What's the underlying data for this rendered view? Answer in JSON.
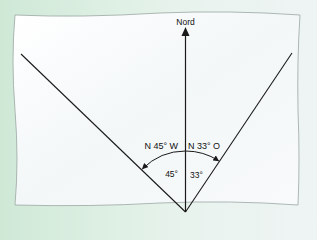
{
  "diagram": {
    "north_label": "Nord",
    "bearing_left_label": "N 45° W",
    "bearing_right_label": "N 33° O",
    "angle_left_label": "45°",
    "angle_right_label": "33°",
    "colors": {
      "background": "#d8ede0",
      "paper": "#f7fafb",
      "paper_edge": "#9aa6a2",
      "lines": "#1a1a1a",
      "text": "#111111"
    },
    "angles_deg": {
      "west_of_north": 45,
      "east_of_north": 33
    }
  }
}
